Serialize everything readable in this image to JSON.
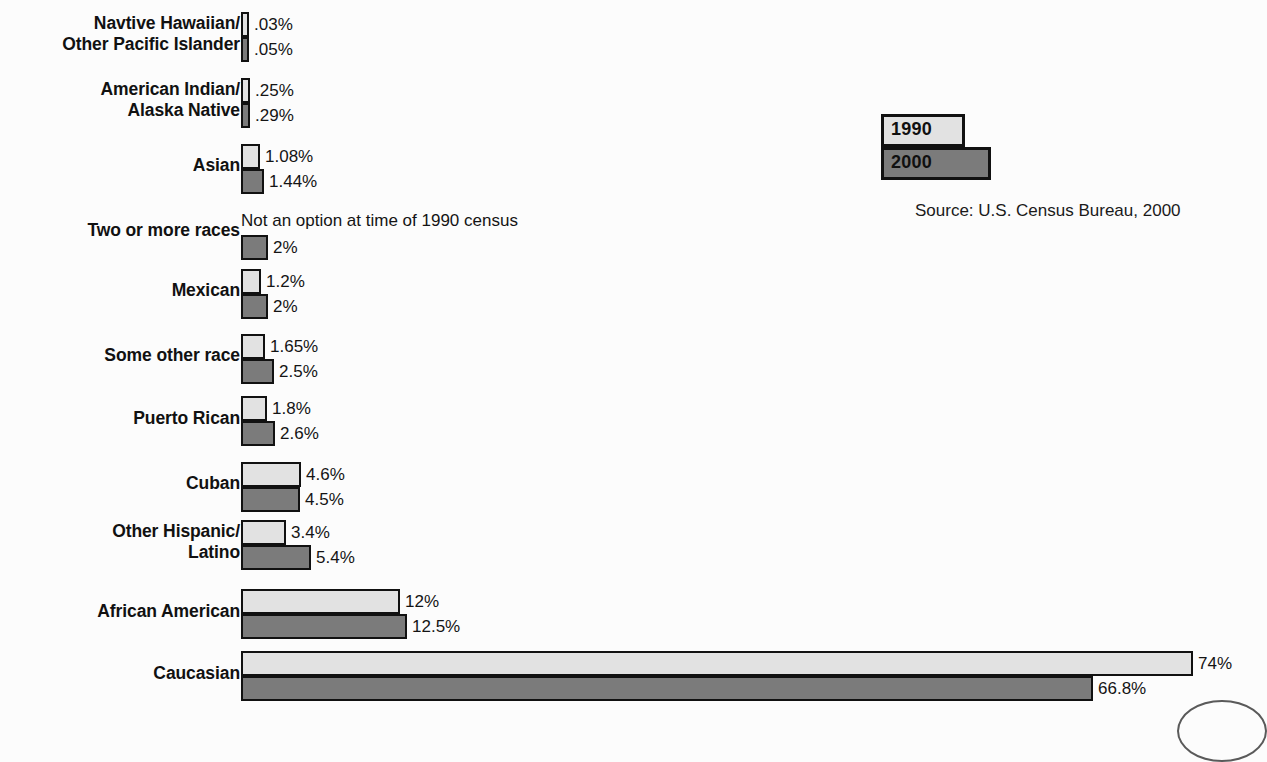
{
  "chart_data": {
    "type": "bar",
    "orientation": "horizontal",
    "title": "",
    "xlabel": "",
    "ylabel": "",
    "grid": false,
    "legend_position": "top-right",
    "source_note": "Source: U.S. Census Bureau, 2000",
    "legend": [
      {
        "name": "1990",
        "swatch": "#e2e2e2"
      },
      {
        "name": "2000",
        "swatch": "#7b7b7b"
      }
    ],
    "categories": [
      "Navtive Hawaiian/\nOther Pacific Islander",
      "American Indian/\nAlaska Native",
      "Asian",
      "Two or more races",
      "Mexican",
      "Some other race",
      "Puerto Rican",
      "Cuban",
      "Other Hispanic/\nLatino",
      "African American",
      "Caucasian"
    ],
    "series": [
      {
        "name": "1990",
        "color": "#e2e2e2",
        "values": [
          0.03,
          0.25,
          1.08,
          null,
          1.2,
          1.65,
          1.8,
          4.6,
          3.4,
          12,
          74
        ],
        "labels": [
          ".03%",
          ".25%",
          "1.08%",
          "Not an option at time of 1990 census",
          "1.2%",
          "1.65%",
          "1.8%",
          "4.6%",
          "3.4%",
          "12%",
          "74%"
        ]
      },
      {
        "name": "2000",
        "color": "#7b7b7b",
        "values": [
          0.05,
          0.29,
          1.44,
          2,
          2,
          2.5,
          2.6,
          4.5,
          5.4,
          12.5,
          66.8
        ],
        "labels": [
          ".05%",
          ".29%",
          "1.44%",
          "2%",
          "2%",
          "2.5%",
          "2.6%",
          "4.5%",
          "5.4%",
          "12.5%",
          "66.8%"
        ]
      }
    ],
    "xlim": [
      0,
      74
    ],
    "unit": "%"
  },
  "rows": [
    {
      "label": "Navtive Hawaiian/\nOther Pacific Islander",
      "top": 12,
      "label_top": 13,
      "v1990": {
        "value": 0.03,
        "label": ".03%",
        "width": 8
      },
      "v2000": {
        "value": 0.05,
        "label": ".05%",
        "width": 8
      }
    },
    {
      "label": "American Indian/\nAlaska Native",
      "top": 78,
      "label_top": 79,
      "v1990": {
        "value": 0.25,
        "label": ".25%",
        "width": 9
      },
      "v2000": {
        "value": 0.29,
        "label": ".29%",
        "width": 9
      }
    },
    {
      "label": "Asian",
      "top": 144,
      "label_top": 155,
      "v1990": {
        "value": 1.08,
        "label": "1.08%",
        "width": 19
      },
      "v2000": {
        "value": 1.44,
        "label": "1.44%",
        "width": 23
      }
    },
    {
      "label": "Two or more races",
      "top": 210,
      "label_top": 220,
      "v1990": {
        "value": null,
        "label": "Not an option at time of 1990 census",
        "width": 0
      },
      "v2000": {
        "value": 2,
        "label": "2%",
        "width": 27
      }
    },
    {
      "label": "Mexican",
      "top": 269,
      "label_top": 280,
      "v1990": {
        "value": 1.2,
        "label": "1.2%",
        "width": 20
      },
      "v2000": {
        "value": 2,
        "label": "2%",
        "width": 27
      }
    },
    {
      "label": "Some other race",
      "top": 334,
      "label_top": 345,
      "v1990": {
        "value": 1.65,
        "label": "1.65%",
        "width": 24
      },
      "v2000": {
        "value": 2.5,
        "label": "2.5%",
        "width": 33
      }
    },
    {
      "label": "Puerto Rican",
      "top": 396,
      "label_top": 408,
      "v1990": {
        "value": 1.8,
        "label": "1.8%",
        "width": 26
      },
      "v2000": {
        "value": 2.6,
        "label": "2.6%",
        "width": 34
      }
    },
    {
      "label": "Cuban",
      "top": 462,
      "label_top": 473,
      "v1990": {
        "value": 4.6,
        "label": "4.6%",
        "width": 60
      },
      "v2000": {
        "value": 4.5,
        "label": "4.5%",
        "width": 59
      }
    },
    {
      "label": "Other Hispanic/\nLatino",
      "top": 520,
      "label_top": 521,
      "v1990": {
        "value": 3.4,
        "label": "3.4%",
        "width": 45
      },
      "v2000": {
        "value": 5.4,
        "label": "5.4%",
        "width": 70
      }
    },
    {
      "label": "African American",
      "top": 589,
      "label_top": 601,
      "v1990": {
        "value": 12,
        "label": "12%",
        "width": 159
      },
      "v2000": {
        "value": 12.5,
        "label": "12.5%",
        "width": 166
      }
    },
    {
      "label": "Caucasian",
      "top": 651,
      "label_top": 663,
      "v1990": {
        "value": 74,
        "label": "74%",
        "width": 952
      },
      "v2000": {
        "value": 66.8,
        "label": "66.8%",
        "width": 852
      }
    }
  ]
}
